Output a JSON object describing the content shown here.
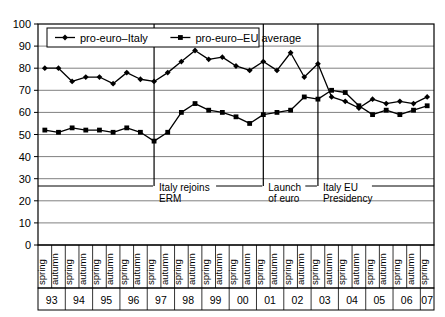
{
  "chart_data": {
    "type": "line",
    "title": "",
    "xlabel": "",
    "ylabel": "",
    "ylim": [
      0,
      100
    ],
    "ytick_step": 10,
    "yticks": [
      0,
      10,
      20,
      30,
      40,
      50,
      60,
      70,
      80,
      90,
      100
    ],
    "grid": true,
    "legend_position": "top-left-inside",
    "x": [
      "spring 93",
      "autumn 93",
      "spring 94",
      "autumn 94",
      "spring 95",
      "autumn 95",
      "spring 96",
      "autumn 96",
      "spring 97",
      "autumn 97",
      "spring 98",
      "autumn 98",
      "spring 99",
      "autumn 99",
      "spring 00",
      "autumn 00",
      "spring 01",
      "autumn 01",
      "spring 02",
      "autumn 02",
      "spring 03",
      "autumn 03",
      "spring 04",
      "autumn 04",
      "spring 05",
      "autumn 05",
      "spring 06",
      "autumn 06",
      "spring 07"
    ],
    "seasons": [
      "spring",
      "autumn",
      "spring",
      "autumn",
      "spring",
      "autumn",
      "spring",
      "autumn",
      "spring",
      "autumn",
      "spring",
      "autumn",
      "spring",
      "autumn",
      "spring",
      "autumn",
      "spring",
      "autumn",
      "spring",
      "autumn",
      "spring",
      "autumn",
      "spring",
      "autumn",
      "spring",
      "autumn",
      "spring",
      "autumn",
      "spring"
    ],
    "year_groups": [
      {
        "label": "93",
        "start": 0,
        "count": 2
      },
      {
        "label": "94",
        "start": 2,
        "count": 2
      },
      {
        "label": "95",
        "start": 4,
        "count": 2
      },
      {
        "label": "96",
        "start": 6,
        "count": 2
      },
      {
        "label": "97",
        "start": 8,
        "count": 2
      },
      {
        "label": "98",
        "start": 10,
        "count": 2
      },
      {
        "label": "99",
        "start": 12,
        "count": 2
      },
      {
        "label": "00",
        "start": 14,
        "count": 2
      },
      {
        "label": "01",
        "start": 16,
        "count": 2
      },
      {
        "label": "02",
        "start": 18,
        "count": 2
      },
      {
        "label": "03",
        "start": 20,
        "count": 2
      },
      {
        "label": "04",
        "start": 22,
        "count": 2
      },
      {
        "label": "05",
        "start": 24,
        "count": 2
      },
      {
        "label": "06",
        "start": 26,
        "count": 2
      },
      {
        "label": "07",
        "start": 28,
        "count": 1
      }
    ],
    "series": [
      {
        "name": "pro-euro–Italy",
        "marker": "diamond",
        "color": "#000000",
        "values": [
          80,
          80,
          74,
          76,
          76,
          73,
          78,
          75,
          74,
          78,
          83,
          88,
          84,
          85,
          81,
          79,
          83,
          79,
          87,
          76,
          82,
          67,
          65,
          62,
          66,
          64,
          65,
          64,
          67
        ]
      },
      {
        "name": "pro-euro–EU average",
        "marker": "square",
        "color": "#000000",
        "values": [
          52,
          51,
          53,
          52,
          52,
          51,
          53,
          51,
          47,
          51,
          60,
          64,
          61,
          60,
          58,
          55,
          59,
          60,
          61,
          67,
          66,
          70,
          69,
          63,
          59,
          61,
          59,
          61,
          63
        ]
      }
    ],
    "annotations": [
      {
        "label_line1": "Italy rejoins",
        "label_line2": "ERM",
        "x_index": 8
      },
      {
        "label_line1": "Launch",
        "label_line2": "of euro",
        "x_index": 16
      },
      {
        "label_line1": "Italy EU",
        "label_line2": "Presidency",
        "x_index": 20
      }
    ]
  }
}
